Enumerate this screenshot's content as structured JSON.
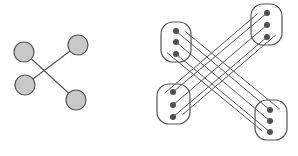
{
  "colors": {
    "stroke": "#555555",
    "node_fill": "#c8c8c8",
    "dot_fill": "#505050",
    "background": "#ffffff"
  },
  "simple_graph": {
    "nodes": [
      {
        "id": "tl",
        "cx": 24,
        "cy": 52,
        "r": 10
      },
      {
        "id": "tr",
        "cx": 78,
        "cy": 45,
        "r": 10
      },
      {
        "id": "bl",
        "cx": 25,
        "cy": 85,
        "r": 10
      },
      {
        "id": "br",
        "cx": 76,
        "cy": 100,
        "r": 10
      }
    ],
    "edges": [
      {
        "from": "tl",
        "to": "br"
      },
      {
        "from": "tr",
        "to": "bl"
      }
    ]
  },
  "expanded_graph": {
    "groups": [
      {
        "id": "tl",
        "box": {
          "x": 161,
          "y": 22,
          "w": 30,
          "h": 40,
          "rx": 12
        },
        "dots": [
          [
            176,
            31
          ],
          [
            176,
            42
          ],
          [
            176,
            54
          ]
        ]
      },
      {
        "id": "tr",
        "box": {
          "x": 251,
          "y": 4,
          "w": 31,
          "h": 41,
          "rx": 12
        },
        "dots": [
          [
            267,
            13
          ],
          [
            267,
            25
          ],
          [
            267,
            37
          ]
        ]
      },
      {
        "id": "bl",
        "box": {
          "x": 157,
          "y": 84,
          "w": 33,
          "h": 40,
          "rx": 12
        },
        "dots": [
          [
            173,
            92
          ],
          [
            173,
            105
          ],
          [
            173,
            117
          ]
        ]
      },
      {
        "id": "br",
        "box": {
          "x": 255,
          "y": 100,
          "w": 32,
          "h": 40,
          "rx": 12
        },
        "dots": [
          [
            270,
            110
          ],
          [
            270,
            121
          ],
          [
            270,
            132
          ]
        ]
      }
    ],
    "bundles": [
      {
        "from": "tl",
        "to": "br"
      },
      {
        "from": "tr",
        "to": "bl"
      }
    ]
  }
}
